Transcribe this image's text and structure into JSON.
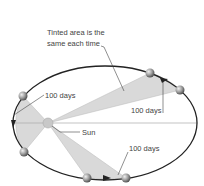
{
  "diagram": {
    "caption_line1": "Tinted area is the",
    "caption_line2": "same each time",
    "sun_label": "Sun",
    "interval_labels": [
      "100 days",
      "100 days",
      "100 days"
    ],
    "colors": {
      "orbit": "#222222",
      "tint": "#d9d9d9",
      "tint_edge": "#b8b8b8",
      "sun": "#c8c8c8",
      "planet": "#9a9a9a",
      "leader": "#444444",
      "axis": "#aaaaaa"
    },
    "orbit": {
      "cx": 105,
      "cy": 123,
      "rx": 92,
      "ry": 57
    },
    "sun": {
      "x": 48,
      "y": 123
    },
    "planets": [
      {
        "x": 150,
        "y": 73
      },
      {
        "x": 180,
        "y": 90
      },
      {
        "x": 23,
        "y": 96
      },
      {
        "x": 24,
        "y": 152
      },
      {
        "x": 87,
        "y": 178
      },
      {
        "x": 126,
        "y": 178
      }
    ]
  }
}
